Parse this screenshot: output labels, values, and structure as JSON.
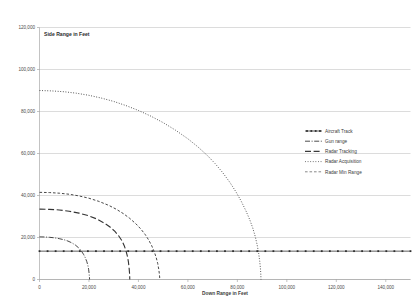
{
  "chart_data": {
    "type": "line",
    "title": "",
    "xlabel": "Down Range in Feet",
    "ylabel": "Side Range in Feet",
    "plot_label": "Side Range in Feet",
    "xlim": [
      0,
      150000
    ],
    "ylim": [
      0,
      120000
    ],
    "grid": "horizontal",
    "legend_position": "right-middle",
    "xticks": [
      0,
      20000,
      40000,
      60000,
      80000,
      100000,
      120000,
      140000
    ],
    "xtick_labels": [
      "0",
      "20,000",
      "40,000",
      "60,000",
      "80,000",
      "100,000",
      "120,000",
      "140,000"
    ],
    "yticks": [
      0,
      20000,
      40000,
      60000,
      80000,
      100000,
      120000
    ],
    "ytick_labels": [
      "0",
      "20,000",
      "40,000",
      "60,000",
      "80,000",
      "100,000",
      "120,000"
    ],
    "series": [
      {
        "name": "Aircraft Track",
        "style": "solid-with-markers",
        "color": "#2f2f2f",
        "width": 0.8,
        "dash": "none",
        "marker": "square",
        "points": [
          [
            0,
            13500
          ],
          [
            150000,
            13500
          ]
        ]
      },
      {
        "name": "Gun range",
        "style": "dash-dot",
        "color": "#3a3a3a",
        "width": 0.9,
        "dash": "5,1.6,1,1.6",
        "marker": "none",
        "points": [
          [
            0,
            20300
          ],
          [
            2000,
            20250
          ],
          [
            4000,
            20100
          ],
          [
            6000,
            19850
          ],
          [
            8000,
            19450
          ],
          [
            10000,
            18900
          ],
          [
            11500,
            18300
          ],
          [
            13000,
            17500
          ],
          [
            14500,
            16400
          ],
          [
            15800,
            15100
          ],
          [
            16900,
            13600
          ],
          [
            17800,
            12000
          ],
          [
            18500,
            10400
          ],
          [
            19100,
            8600
          ],
          [
            19550,
            6800
          ],
          [
            19850,
            4900
          ],
          [
            20050,
            3000
          ],
          [
            20180,
            1400
          ],
          [
            20250,
            0
          ]
        ]
      },
      {
        "name": "Radar Tracking",
        "style": "long-dash",
        "color": "#3a3a3a",
        "width": 1.1,
        "dash": "6,2.6",
        "marker": "none",
        "points": [
          [
            0,
            33500
          ],
          [
            4000,
            33400
          ],
          [
            8000,
            33100
          ],
          [
            12000,
            32500
          ],
          [
            16000,
            31600
          ],
          [
            20000,
            30300
          ],
          [
            23000,
            28900
          ],
          [
            26000,
            27000
          ],
          [
            28500,
            25000
          ],
          [
            30500,
            22900
          ],
          [
            32000,
            20800
          ],
          [
            33300,
            18500
          ],
          [
            34300,
            16000
          ],
          [
            35000,
            13500
          ],
          [
            35550,
            11000
          ],
          [
            35950,
            8400
          ],
          [
            36200,
            5900
          ],
          [
            36380,
            3400
          ],
          [
            36470,
            1500
          ],
          [
            36500,
            0
          ]
        ]
      },
      {
        "name": "Radar Acquisition",
        "style": "fine-dotted",
        "color": "#5a5a5a",
        "width": 0.9,
        "dash": "0.9,1.7",
        "marker": "none",
        "points": [
          [
            0,
            90000
          ],
          [
            5000,
            89800
          ],
          [
            10000,
            89400
          ],
          [
            15000,
            88700
          ],
          [
            20000,
            87700
          ],
          [
            25000,
            86400
          ],
          [
            30000,
            84800
          ],
          [
            35000,
            82800
          ],
          [
            40000,
            80500
          ],
          [
            45000,
            77800
          ],
          [
            50000,
            74700
          ],
          [
            55000,
            71100
          ],
          [
            60000,
            67000
          ],
          [
            64000,
            63200
          ],
          [
            68000,
            58900
          ],
          [
            71000,
            55200
          ],
          [
            74000,
            51000
          ],
          [
            77000,
            46200
          ],
          [
            79500,
            41600
          ],
          [
            81500,
            37400
          ],
          [
            83500,
            32600
          ],
          [
            85000,
            28500
          ],
          [
            86200,
            24600
          ],
          [
            87200,
            20600
          ],
          [
            88000,
            16500
          ],
          [
            88600,
            12500
          ],
          [
            89050,
            8600
          ],
          [
            89350,
            5000
          ],
          [
            89500,
            2000
          ],
          [
            89550,
            0
          ]
        ]
      },
      {
        "name": "Radar Min Range",
        "style": "dashed",
        "color": "#7a7a7a",
        "width": 0.9,
        "dash": "2.6,1.9",
        "marker": "none",
        "points": [
          [
            0,
            41500
          ],
          [
            4000,
            41400
          ],
          [
            8000,
            41100
          ],
          [
            12000,
            40600
          ],
          [
            16000,
            39800
          ],
          [
            20000,
            38700
          ],
          [
            24000,
            37200
          ],
          [
            28000,
            35300
          ],
          [
            31000,
            33500
          ],
          [
            34000,
            31300
          ],
          [
            36500,
            29100
          ],
          [
            39000,
            26500
          ],
          [
            41000,
            24000
          ],
          [
            42800,
            21300
          ],
          [
            44200,
            18700
          ],
          [
            45400,
            16000
          ],
          [
            46400,
            13200
          ],
          [
            47200,
            10400
          ],
          [
            47800,
            7600
          ],
          [
            48200,
            5000
          ],
          [
            48450,
            2800
          ],
          [
            48580,
            1200
          ],
          [
            48620,
            0
          ]
        ]
      }
    ]
  },
  "legend": {
    "entries": [
      {
        "label": "Aircraft Track"
      },
      {
        "label": "Gun range"
      },
      {
        "label": "Radar Tracking"
      },
      {
        "label": "Radar Acquisition"
      },
      {
        "label": "Radar Min Range"
      }
    ]
  }
}
